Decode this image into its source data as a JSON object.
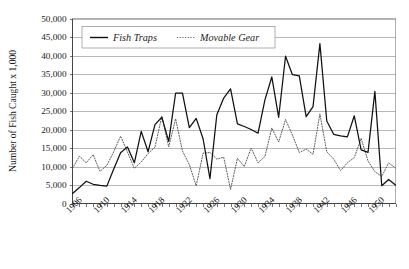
{
  "chart_data": {
    "type": "line",
    "title": "",
    "xlabel": "",
    "ylabel": "Number of Fish Caught x 1,000",
    "ylim": [
      0,
      50000
    ],
    "xlim": [
      1906,
      1953
    ],
    "grid": true,
    "legend_position": "top-left-inside",
    "ytick_labels": [
      "0",
      "5,000",
      "10,000",
      "15,000",
      "20,000",
      "25,000",
      "30,000",
      "35,000",
      "40,000",
      "45,000",
      "50,000"
    ],
    "ytick_values": [
      0,
      5000,
      10000,
      15000,
      20000,
      25000,
      30000,
      35000,
      40000,
      45000,
      50000
    ],
    "xtick_labels": [
      "1906",
      "1910",
      "1914",
      "1918",
      "1922",
      "1926",
      "1930",
      "1934",
      "1938",
      "1942",
      "1946",
      "1950"
    ],
    "xtick_values": [
      1906,
      1910,
      1914,
      1918,
      1922,
      1926,
      1930,
      1934,
      1938,
      1942,
      1946,
      1950
    ],
    "x": [
      1906,
      1907,
      1908,
      1909,
      1910,
      1911,
      1912,
      1913,
      1914,
      1915,
      1916,
      1917,
      1918,
      1919,
      1920,
      1921,
      1922,
      1923,
      1924,
      1925,
      1926,
      1927,
      1928,
      1929,
      1930,
      1931,
      1932,
      1933,
      1934,
      1935,
      1936,
      1937,
      1938,
      1939,
      1940,
      1941,
      1942,
      1943,
      1944,
      1945,
      1946,
      1947,
      1948,
      1949,
      1950,
      1951,
      1952,
      1953
    ],
    "series": [
      {
        "name": "Fish Traps",
        "style": "solid",
        "color": "#101010",
        "values": [
          2700,
          4300,
          6000,
          5200,
          4900,
          4700,
          9300,
          13700,
          15300,
          11000,
          19500,
          14000,
          21300,
          23300,
          16800,
          29800,
          29800,
          20500,
          23000,
          17500,
          6700,
          24000,
          28500,
          31000,
          21500,
          20800,
          20000,
          19000,
          28000,
          34200,
          23300,
          39800,
          34800,
          34500,
          23500,
          26200,
          43200,
          22300,
          18700,
          18300,
          18000,
          23700,
          14500,
          13800,
          30300,
          4800,
          6500,
          5000
        ]
      },
      {
        "name": "Movable Gear",
        "style": "dotted",
        "color": "#5a5a5a",
        "values": [
          9500,
          12800,
          11000,
          13200,
          8700,
          10300,
          14000,
          18200,
          13900,
          9500,
          11200,
          13500,
          15200,
          23600,
          15300,
          22900,
          14200,
          10500,
          4800,
          13600,
          13800,
          12000,
          12500,
          3800,
          12200,
          10000,
          15000,
          11000,
          12700,
          20400,
          16600,
          22700,
          18500,
          13800,
          14700,
          13300,
          24200,
          14000,
          12000,
          8900,
          11000,
          12400,
          17600,
          11500,
          8600,
          7300,
          11000,
          9600
        ]
      }
    ]
  },
  "legend": {
    "entries": [
      {
        "label": "Fish Traps"
      },
      {
        "label": "Movable Gear"
      }
    ]
  },
  "axes": {
    "ylabel": "Number of Fish Caught x 1,000"
  }
}
